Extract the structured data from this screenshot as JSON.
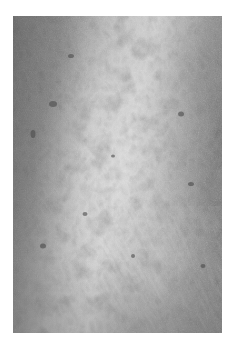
{
  "image": {
    "subject": "close-up grayscale photograph of skin surface texture",
    "alt": "Grayscale close-up of skin showing a fine mottled, scaly texture with scattered dark spots",
    "colors": {
      "background": "#ffffff",
      "dark_tone": "#6f6f6f",
      "mid_tone": "#9a9a9a",
      "light_tone": "#d6d6d6",
      "highlight_tone": "#e8e8e8",
      "spot_tone": "#4a4a4a"
    }
  }
}
